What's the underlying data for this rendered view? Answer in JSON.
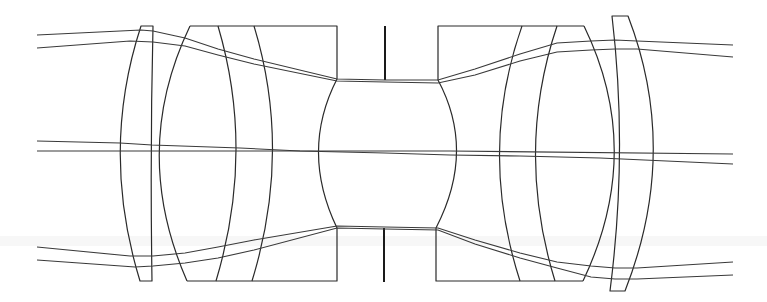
{
  "diagram": {
    "type": "optical-lens-layout",
    "colors": {
      "background": "#ffffff",
      "lens_stroke": "#2a2a2a",
      "ray_stroke": "#3a3a3a",
      "stop_stroke": "#1a1a1a"
    },
    "optical_axis_y": 151,
    "elements": [
      {
        "name": "left-meniscus-lens",
        "role": "front element"
      },
      {
        "name": "left-cemented-group",
        "role": "front cemented triplet"
      },
      {
        "name": "aperture-stop",
        "role": "stop"
      },
      {
        "name": "right-cemented-group",
        "role": "rear cemented triplet"
      },
      {
        "name": "right-meniscus-lens",
        "role": "rear element"
      }
    ],
    "ray_bundles": [
      {
        "name": "upper-marginal-bundle"
      },
      {
        "name": "axial-chief-bundle"
      },
      {
        "name": "lower-marginal-bundle"
      }
    ]
  }
}
